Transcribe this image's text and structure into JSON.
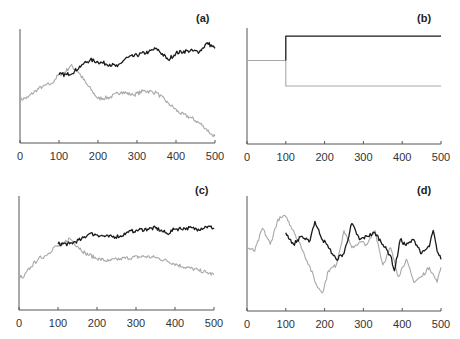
{
  "colors": {
    "axis": "#555555",
    "dark_series": "#1a1a1a",
    "light_series": "#a8a8a8"
  },
  "chart_data": [
    {
      "type": "line",
      "title": "(a)",
      "xlim": [
        0,
        500
      ],
      "xticks": [
        0,
        100,
        200,
        300,
        400,
        500
      ],
      "ylabel": "",
      "xlabel": "",
      "grid": false,
      "series": [
        {
          "name": "light",
          "x": [
            0,
            20,
            40,
            60,
            80,
            100,
            115,
            130,
            150,
            170,
            200,
            230,
            260,
            290,
            320,
            350,
            380,
            410,
            440,
            470,
            490,
            500
          ],
          "y": [
            0.38,
            0.4,
            0.46,
            0.5,
            0.52,
            0.6,
            0.62,
            0.68,
            0.62,
            0.52,
            0.39,
            0.4,
            0.45,
            0.42,
            0.46,
            0.44,
            0.35,
            0.26,
            0.22,
            0.15,
            0.08,
            0.06
          ]
        },
        {
          "name": "dark",
          "x": [
            100,
            120,
            140,
            160,
            180,
            200,
            230,
            250,
            270,
            300,
            330,
            350,
            380,
            400,
            430,
            460,
            480,
            500
          ],
          "y": [
            0.6,
            0.6,
            0.63,
            0.69,
            0.73,
            0.71,
            0.69,
            0.67,
            0.74,
            0.77,
            0.8,
            0.83,
            0.73,
            0.79,
            0.81,
            0.8,
            0.88,
            0.83
          ]
        }
      ]
    },
    {
      "type": "line",
      "title": "(b)",
      "xlim": [
        0,
        500
      ],
      "xticks": [
        0,
        100,
        200,
        300,
        400,
        500
      ],
      "grid": false,
      "series": [
        {
          "name": "light",
          "x": [
            0,
            100,
            100,
            500
          ],
          "y": [
            0.72,
            0.72,
            0.5,
            0.5
          ]
        },
        {
          "name": "dark",
          "x": [
            100,
            100,
            500
          ],
          "y": [
            0.72,
            0.93,
            0.93
          ]
        }
      ]
    },
    {
      "type": "line",
      "title": "(c)",
      "xlim": [
        0,
        500
      ],
      "xticks": [
        0,
        100,
        200,
        300,
        400,
        500
      ],
      "grid": false,
      "series": [
        {
          "name": "light",
          "x": [
            0,
            10,
            30,
            50,
            70,
            90,
            110,
            130,
            150,
            170,
            200,
            230,
            260,
            290,
            320,
            350,
            380,
            420,
            460,
            480,
            500
          ],
          "y": [
            0.3,
            0.28,
            0.38,
            0.45,
            0.48,
            0.55,
            0.57,
            0.63,
            0.56,
            0.5,
            0.45,
            0.43,
            0.45,
            0.46,
            0.47,
            0.46,
            0.43,
            0.38,
            0.35,
            0.33,
            0.31
          ]
        },
        {
          "name": "dark",
          "x": [
            100,
            130,
            160,
            180,
            200,
            230,
            260,
            280,
            300,
            330,
            350,
            380,
            400,
            430,
            460,
            480,
            500
          ],
          "y": [
            0.58,
            0.58,
            0.62,
            0.67,
            0.66,
            0.64,
            0.65,
            0.68,
            0.7,
            0.71,
            0.72,
            0.67,
            0.71,
            0.72,
            0.71,
            0.73,
            0.72
          ]
        }
      ]
    },
    {
      "type": "line",
      "title": "(d)",
      "xlim": [
        0,
        500
      ],
      "xticks": [
        0,
        100,
        200,
        300,
        400,
        500
      ],
      "grid": false,
      "series": [
        {
          "name": "light",
          "x": [
            0,
            20,
            40,
            60,
            80,
            100,
            120,
            140,
            160,
            180,
            195,
            210,
            230,
            250,
            270,
            290,
            310,
            330,
            350,
            370,
            390,
            410,
            430,
            450,
            470,
            490,
            500
          ],
          "y": [
            0.55,
            0.52,
            0.72,
            0.58,
            0.8,
            0.82,
            0.7,
            0.55,
            0.4,
            0.22,
            0.16,
            0.35,
            0.4,
            0.7,
            0.55,
            0.6,
            0.58,
            0.7,
            0.4,
            0.55,
            0.3,
            0.45,
            0.25,
            0.3,
            0.38,
            0.25,
            0.38
          ]
        },
        {
          "name": "dark",
          "x": [
            100,
            120,
            140,
            160,
            175,
            190,
            210,
            230,
            250,
            270,
            290,
            310,
            330,
            350,
            370,
            380,
            395,
            410,
            430,
            450,
            470,
            480,
            490,
            500
          ],
          "y": [
            0.68,
            0.58,
            0.65,
            0.6,
            0.78,
            0.65,
            0.55,
            0.45,
            0.5,
            0.76,
            0.62,
            0.65,
            0.68,
            0.58,
            0.48,
            0.35,
            0.62,
            0.57,
            0.62,
            0.5,
            0.56,
            0.7,
            0.52,
            0.45
          ]
        }
      ]
    }
  ],
  "panels": [
    {
      "label": "(a)",
      "box": {
        "x0": 20,
        "x1": 215,
        "y_top": 29,
        "y_base": 143
      },
      "label_pos": [
        196,
        22
      ]
    },
    {
      "label": "(b)",
      "box": {
        "x0": 247,
        "x1": 441,
        "y_top": 28,
        "y_base": 144
      },
      "label_pos": [
        417,
        22
      ]
    },
    {
      "label": "(c)",
      "box": {
        "x0": 19,
        "x1": 214,
        "y_top": 196,
        "y_base": 310
      },
      "label_pos": [
        195,
        194
      ]
    },
    {
      "label": "(d)",
      "box": {
        "x0": 247,
        "x1": 441,
        "y_top": 196,
        "y_base": 311
      },
      "label_pos": [
        417,
        194
      ]
    }
  ],
  "tick_labels": [
    "0",
    "100",
    "200",
    "300",
    "400",
    "500"
  ]
}
